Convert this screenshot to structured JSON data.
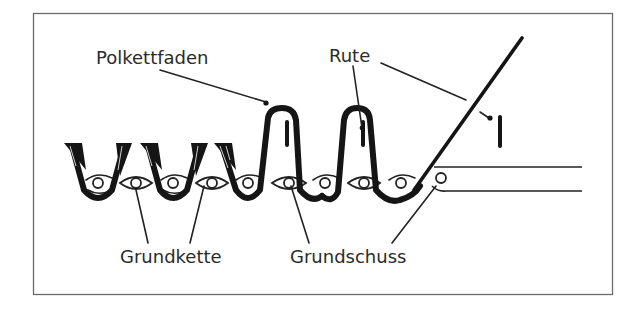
{
  "diagram": {
    "type": "textile cross-section (pile fabric / velvet weaving)",
    "labels": {
      "pile_warp": "Polkettfaden",
      "wire": "Rute",
      "ground_warp": "Grundkette",
      "ground_weft": "Grundschuss"
    },
    "colors": {
      "ink": "#151515",
      "text": "#2b2b2b",
      "background": "#ffffff",
      "frame": "#6a6a6a"
    },
    "elements": {
      "cut_pile_tufts": 3,
      "uncut_loops_with_wires": 2,
      "ground_weft_beads": 10,
      "loose_wire_marker": 1
    }
  }
}
